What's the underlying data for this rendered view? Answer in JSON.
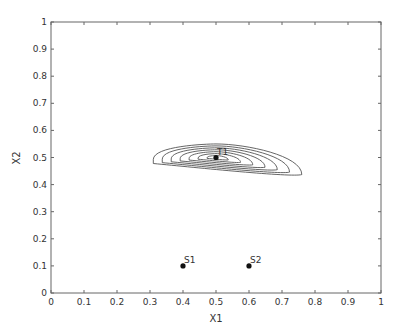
{
  "chart_data": {
    "type": "contour",
    "title": "",
    "xlabel": "X1",
    "ylabel": "X2",
    "xlim": [
      0,
      1
    ],
    "ylim": [
      0,
      1
    ],
    "xticks": [
      "0",
      "0.1",
      "0.2",
      "0.3",
      "0.4",
      "0.5",
      "0.6",
      "0.7",
      "0.8",
      "0.9",
      "1"
    ],
    "yticks": [
      "0",
      "0.1",
      "0.2",
      "0.3",
      "0.4",
      "0.5",
      "0.6",
      "0.7",
      "0.8",
      "0.9",
      "1"
    ],
    "grid": false,
    "points": [
      {
        "label": "T1",
        "x": 0.5,
        "y": 0.5
      },
      {
        "label": "S1",
        "x": 0.4,
        "y": 0.1
      },
      {
        "label": "S2",
        "x": 0.6,
        "y": 0.1
      }
    ],
    "contours": {
      "center": [
        0.5,
        0.5
      ],
      "levels": 7,
      "description": "Nested elongated closed contours centered near T1, skewed to the right, extending roughly from x=0.31 to x=0.76 and y=0.43 to y=0.55"
    }
  }
}
